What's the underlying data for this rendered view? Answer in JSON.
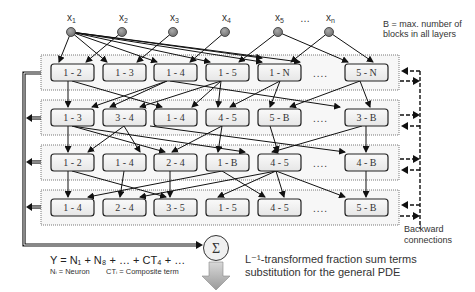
{
  "inputs": [
    {
      "label": "x1",
      "main": "x",
      "sub": "1"
    },
    {
      "label": "x2",
      "main": "x",
      "sub": "2"
    },
    {
      "label": "x3",
      "main": "x",
      "sub": "3"
    },
    {
      "label": "x4",
      "main": "x",
      "sub": "4"
    },
    {
      "label": "x5",
      "main": "x",
      "sub": "5"
    },
    {
      "label": "xn",
      "main": "x",
      "sub": "n"
    }
  ],
  "inputs_ellipsis": "…",
  "note_b": {
    "line1": "B = max. number of",
    "line2": "blocks in all layers"
  },
  "layers": [
    {
      "blocks": [
        "1 - 2",
        "1 - 3",
        "1 - 4",
        "1 - 5",
        "1 - N"
      ],
      "last": "5 - N"
    },
    {
      "blocks": [
        "1 - 3",
        "3 - 4",
        "1 - 4",
        "4 - 5",
        "5 - B"
      ],
      "last": "3 - B"
    },
    {
      "blocks": [
        "1 - 2",
        "1 - 4",
        "2 - 4",
        "1 - B",
        "4 - 5"
      ],
      "last": "4 - B"
    },
    {
      "blocks": [
        "1 - 4",
        "2 - 4",
        "3 - 5",
        "1 - 5",
        "4 - 5"
      ],
      "last": "5 - B"
    }
  ],
  "layer_ellipsis": "....",
  "backward": {
    "line1": "Backward",
    "line2": "connections"
  },
  "sum_symbol": "Σ",
  "formula": {
    "main": "Y = N₁ + N₈ + … + CT₄ + …",
    "legend_neuron": "Nᵢ = Neuron",
    "legend_ct": "CTᵢ = Composite term"
  },
  "pde": {
    "line1": "L⁻¹-transformed fraction sum terms",
    "line2": "substitution for the general PDE"
  },
  "colors": {
    "node_fill": "#8a8a8a",
    "box_fill": "#f2f2f2",
    "line": "#111111"
  }
}
